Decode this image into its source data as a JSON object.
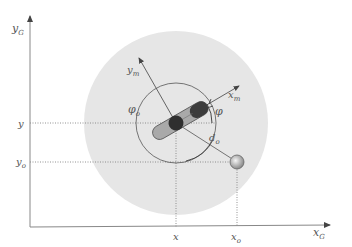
{
  "diagram": {
    "axes": {
      "x_label": "x",
      "x_sub": "G",
      "y_label": "y",
      "y_sub": "G"
    },
    "robot_axes": {
      "x_label": "x",
      "x_sub": "m",
      "y_label": "y",
      "y_sub": "m"
    },
    "ticks": {
      "x": {
        "label": "x"
      },
      "xo": {
        "label": "x",
        "sub": "o"
      },
      "y": {
        "label": "y"
      },
      "yo": {
        "label": "y",
        "sub": "o"
      }
    },
    "angles": {
      "phi": "φ",
      "phi_o": "φ",
      "phi_o_sub": "o"
    },
    "distance": {
      "label": "d",
      "sub": "o"
    },
    "colors": {
      "sensing_region": "#e6e6e6",
      "robot_body": "#a9a9a9",
      "robot_center": "#2f2f2f",
      "axis": "#888888"
    }
  }
}
